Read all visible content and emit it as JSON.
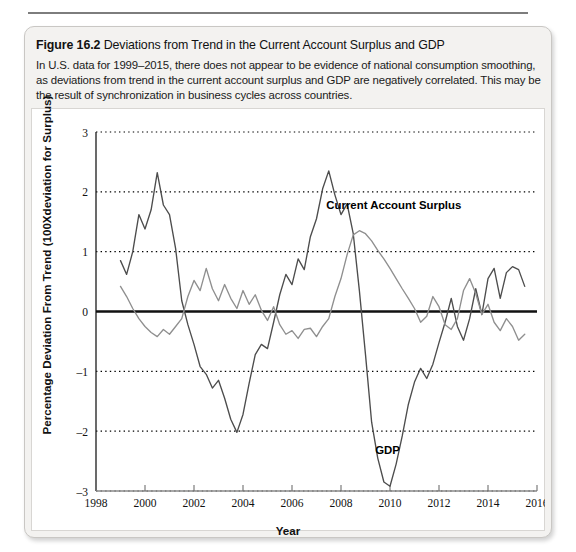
{
  "figure": {
    "label": "Figure 16.2",
    "title": "Deviations from Trend in the Current Account Surplus and GDP",
    "caption": "In U.S. data for 1999–2015, there does not appear to be evidence of national consumption smoothing, as deviations from trend in the current account surplus and GDP are negatively correlated. This may be the result of synchronization in business cycles across countries."
  },
  "chart_data": {
    "type": "line",
    "title": "Deviations from Trend in the Current Account Surplus and GDP",
    "xlabel": "Year",
    "ylabel": "Percentage Deviation From Trend (100Xdeviation for Surplus)",
    "xlim": [
      1998,
      2016
    ],
    "ylim": [
      -3,
      3
    ],
    "xticks": [
      1998,
      2000,
      2002,
      2004,
      2006,
      2008,
      2010,
      2012,
      2014,
      2016
    ],
    "yticks": [
      -3,
      -2,
      -1,
      0,
      1,
      2,
      3
    ],
    "grid": "horizontal-dotted",
    "legend_position": "inline-annotation",
    "zero_line": 0,
    "annotations": [
      {
        "text": "Current Account Surplus",
        "x": 2007.4,
        "y": 1.72
      },
      {
        "text": "GDP",
        "x": 2009.9,
        "y": -2.38
      }
    ],
    "x": [
      1999.0,
      1999.25,
      1999.5,
      1999.75,
      2000.0,
      2000.25,
      2000.5,
      2000.75,
      2001.0,
      2001.25,
      2001.5,
      2001.75,
      2002.0,
      2002.25,
      2002.5,
      2002.75,
      2003.0,
      2003.25,
      2003.5,
      2003.75,
      2004.0,
      2004.25,
      2004.5,
      2004.75,
      2005.0,
      2005.25,
      2005.5,
      2005.75,
      2006.0,
      2006.25,
      2006.5,
      2006.75,
      2007.0,
      2007.25,
      2007.5,
      2007.75,
      2008.0,
      2008.25,
      2008.5,
      2008.75,
      2009.0,
      2009.25,
      2009.5,
      2009.75,
      2010.0,
      2010.25,
      2010.5,
      2010.75,
      2011.0,
      2011.25,
      2011.5,
      2011.75,
      2012.0,
      2012.25,
      2012.5,
      2012.75,
      2013.0,
      2013.25,
      2013.5,
      2013.75,
      2014.0,
      2014.25,
      2014.5,
      2014.75,
      2015.0,
      2015.25,
      2015.5
    ],
    "series": [
      {
        "name": "GDP",
        "color": "#4d4d4d",
        "values": [
          0.85,
          0.62,
          1.0,
          1.62,
          1.38,
          1.7,
          2.32,
          1.78,
          1.62,
          1.05,
          0.18,
          -0.22,
          -0.55,
          -0.92,
          -1.05,
          -1.28,
          -1.15,
          -1.45,
          -1.8,
          -2.02,
          -1.72,
          -1.2,
          -0.72,
          -0.55,
          -0.62,
          -0.18,
          0.28,
          0.62,
          0.45,
          0.88,
          0.7,
          1.25,
          1.55,
          2.05,
          2.35,
          1.95,
          1.62,
          1.8,
          1.3,
          0.35,
          -0.72,
          -1.85,
          -2.45,
          -2.85,
          -2.92,
          -2.55,
          -2.08,
          -1.55,
          -1.18,
          -0.95,
          -1.12,
          -0.88,
          -0.52,
          -0.18,
          0.22,
          -0.25,
          -0.48,
          -0.12,
          0.38,
          -0.05,
          0.55,
          0.72,
          0.22,
          0.65,
          0.75,
          0.7,
          0.42
        ]
      },
      {
        "name": "Current Account Surplus",
        "color": "#8f8f8f",
        "values": [
          0.42,
          0.25,
          0.05,
          -0.12,
          -0.25,
          -0.35,
          -0.42,
          -0.3,
          -0.38,
          -0.25,
          -0.12,
          0.25,
          0.52,
          0.35,
          0.72,
          0.38,
          0.18,
          0.45,
          0.22,
          0.05,
          0.35,
          0.12,
          0.28,
          0.02,
          -0.15,
          0.08,
          -0.22,
          -0.38,
          -0.32,
          -0.45,
          -0.3,
          -0.28,
          -0.42,
          -0.25,
          -0.12,
          0.25,
          0.55,
          0.95,
          1.28,
          1.35,
          1.3,
          1.18,
          1.02,
          0.88,
          0.72,
          0.55,
          0.38,
          0.22,
          0.05,
          -0.18,
          -0.08,
          0.25,
          0.08,
          -0.22,
          -0.3,
          -0.12,
          0.35,
          0.55,
          0.3,
          -0.05,
          0.12,
          -0.18,
          -0.32,
          -0.12,
          -0.25,
          -0.48,
          -0.38
        ]
      }
    ]
  }
}
